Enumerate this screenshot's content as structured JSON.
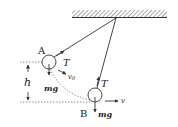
{
  "diagram": {
    "colors": {
      "line": "#333333",
      "hatch": "#555555",
      "background": "#ffffff"
    },
    "points": {
      "A": {
        "label": "A"
      },
      "B": {
        "label": "B"
      }
    },
    "labels": {
      "tension_A": "T",
      "tension_B": "T",
      "gravity_A": "mg",
      "gravity_B": "mg",
      "velocity_A": "v",
      "velocity_A_sub": "0",
      "velocity_B": "v",
      "height": "h"
    }
  }
}
